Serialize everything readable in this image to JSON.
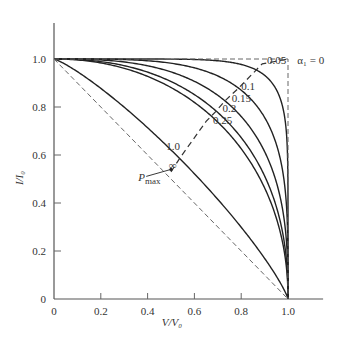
{
  "chart_data": {
    "type": "line",
    "title": "",
    "xlabel": "V/V₀",
    "ylabel": "I/I₀",
    "xlim": [
      0,
      1.15
    ],
    "ylim": [
      0,
      1.15
    ],
    "grid": false,
    "x_ticks": [
      0,
      0.2,
      0.4,
      0.6,
      0.8,
      1.0
    ],
    "x_tick_labels": [
      "0",
      "0.2",
      "0.4",
      "0.6",
      "0.8",
      "1.0"
    ],
    "y_ticks": [
      0,
      0.2,
      0.4,
      0.6,
      0.8,
      1.0
    ],
    "y_tick_labels": [
      "0",
      "0.2",
      "0.4",
      "0.6",
      "0.8",
      "1.0"
    ],
    "parameter_name": "α₁",
    "series": [
      {
        "name": "0.05",
        "alpha": 0.05,
        "style": "solid",
        "shape_exponent": 8.0,
        "label_at": [
          0.91,
          0.98
        ]
      },
      {
        "name": "0.1",
        "alpha": 0.1,
        "style": "solid",
        "shape_exponent": 3.9,
        "label_at": [
          0.8,
          0.87
        ]
      },
      {
        "name": "0.15",
        "alpha": 0.15,
        "style": "solid",
        "shape_exponent": 2.8,
        "label_at": [
          0.76,
          0.82
        ]
      },
      {
        "name": "0.2",
        "alpha": 0.2,
        "style": "solid",
        "shape_exponent": 2.3,
        "label_at": [
          0.72,
          0.78
        ]
      },
      {
        "name": "0.25",
        "alpha": 0.25,
        "style": "solid",
        "shape_exponent": 2.1,
        "label_at": [
          0.68,
          0.73
        ]
      },
      {
        "name": "1.0",
        "alpha": 1.0,
        "style": "solid",
        "shape_exponent": 1.2,
        "label_at": [
          0.48,
          0.62
        ]
      },
      {
        "name": "∞",
        "alpha": "infinity",
        "style": "dashed",
        "points": [
          [
            0,
            1
          ],
          [
            1,
            0
          ]
        ],
        "label_at": [
          0.49,
          0.54
        ]
      },
      {
        "name": "α₁ = 0",
        "alpha": 0,
        "style": "dashed",
        "points": [
          [
            0,
            1
          ],
          [
            1,
            1
          ],
          [
            1,
            0
          ]
        ],
        "label_at": [
          1.04,
          0.98
        ]
      }
    ],
    "pmax_locus": {
      "style": "dashed",
      "points": [
        [
          0.5,
          0.53
        ],
        [
          0.54,
          0.59
        ],
        [
          0.65,
          0.74
        ],
        [
          0.69,
          0.78
        ],
        [
          0.73,
          0.825
        ],
        [
          0.79,
          0.88
        ],
        [
          0.89,
          0.98
        ],
        [
          1.0,
          1.0
        ]
      ]
    },
    "annotations": [
      {
        "text": "P",
        "subscript": "max",
        "at": [
          0.36,
          0.49
        ],
        "arrow_to": [
          0.5,
          0.54
        ]
      }
    ]
  }
}
